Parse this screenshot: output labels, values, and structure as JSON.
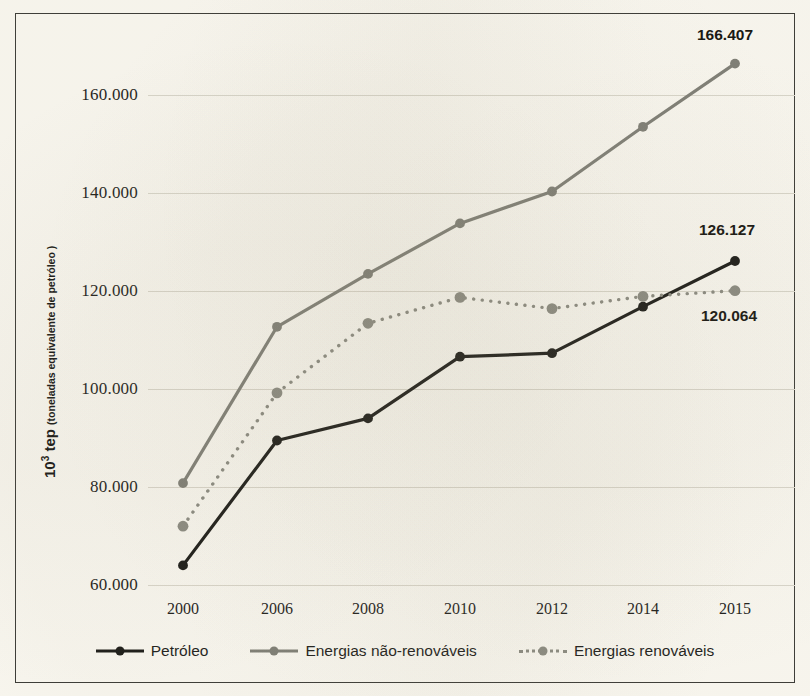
{
  "chart_data": {
    "type": "line",
    "title": "",
    "xlabel": "",
    "ylabel": "10³ tep (toneladas equivalente de petróleo )",
    "ylabel_main": "tep",
    "ylabel_exponent": "3",
    "ylabel_base": "10",
    "ylabel_note": "(toneladas equivalente de petróleo )",
    "categories": [
      "2000",
      "2006",
      "2008",
      "2010",
      "2012",
      "2014",
      "2015"
    ],
    "ylim": [
      55000,
      172000
    ],
    "yticks": [
      60000,
      80000,
      100000,
      120000,
      140000,
      160000
    ],
    "ytick_labels": [
      "60.000",
      "80.000",
      "100.000",
      "120.000",
      "140.000",
      "160.000"
    ],
    "grid": true,
    "legend_position": "bottom",
    "series": [
      {
        "name": "Petróleo",
        "color": "#1a1a17",
        "style": "solid",
        "values": [
          64000,
          89500,
          94000,
          106600,
          107300,
          116800,
          126127
        ],
        "end_label": "126.127"
      },
      {
        "name": "Energias não-renováveis",
        "color": "#7e7e76",
        "style": "solid",
        "values": [
          80800,
          112700,
          123500,
          133800,
          140300,
          153500,
          166407
        ],
        "end_label": "166.407"
      },
      {
        "name": "Energias renováveis",
        "color": "#8a8a81",
        "style": "dotted",
        "values": [
          72000,
          99200,
          113400,
          118700,
          116400,
          118900,
          120064
        ],
        "end_label": "120.064"
      }
    ],
    "annotations": [
      {
        "text": "166.407",
        "series": "Energias não-renováveis",
        "category": "2015"
      },
      {
        "text": "126.127",
        "series": "Petróleo",
        "category": "2015"
      },
      {
        "text": "120.064",
        "series": "Energias renováveis",
        "category": "2015"
      }
    ]
  },
  "legend": {
    "items": [
      {
        "label": "Petróleo"
      },
      {
        "label": "Energias não-renováveis"
      },
      {
        "label": "Energias renováveis"
      }
    ]
  },
  "colors": {
    "background": "#faf8f1",
    "frame": "#3a3a36",
    "grid": "#d9d6cb",
    "text": "#1d1d1b",
    "series_dark": "#1a1a17",
    "series_gray": "#7e7e76",
    "series_gray_dotted": "#8a8a81"
  }
}
